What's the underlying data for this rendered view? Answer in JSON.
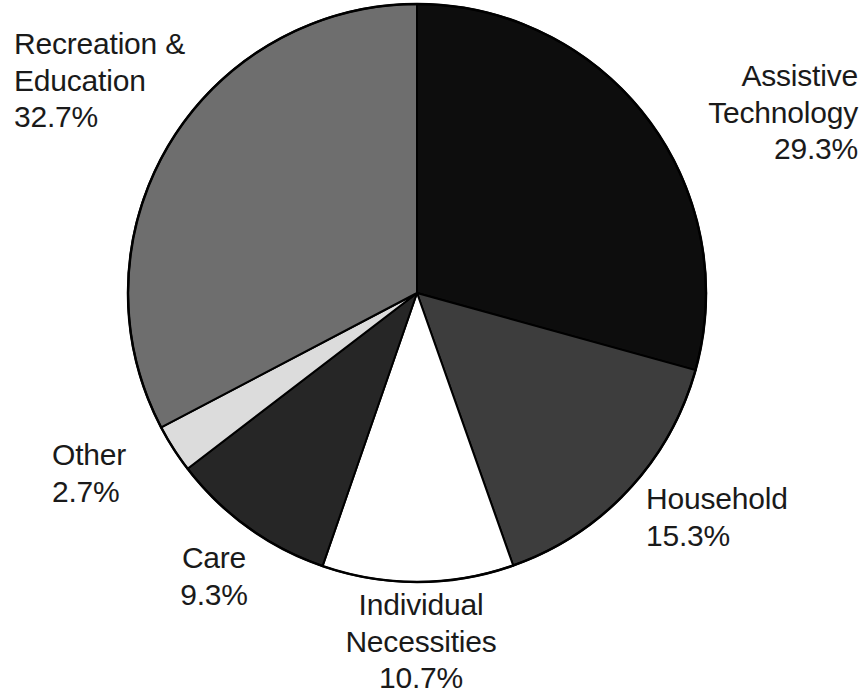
{
  "chart_data": {
    "type": "pie",
    "title": "",
    "subtitle": "",
    "xlabel": "",
    "ylabel": "",
    "legend_position": "none",
    "grid": false,
    "value_unit": "percent",
    "start_angle_deg": 0,
    "direction": "clockwise",
    "categories": [
      "Assistive Technology",
      "Household",
      "Individual Necessities",
      "Care",
      "Other",
      "Recreation & Education"
    ],
    "values": [
      29.3,
      15.3,
      10.7,
      9.3,
      2.7,
      32.7
    ],
    "colors": [
      "#0d0d0d",
      "#3d3d3d",
      "#ffffff",
      "#262626",
      "#dcdcdc",
      "#6e6e6e"
    ],
    "slices": [
      {
        "label": "Assistive Technology",
        "value": 29.3,
        "value_label": "29.3%",
        "color": "#0d0d0d",
        "start_deg": 0,
        "end_deg": 105.48
      },
      {
        "label": "Household",
        "value": 15.3,
        "value_label": "15.3%",
        "color": "#3d3d3d",
        "start_deg": 105.48,
        "end_deg": 160.56
      },
      {
        "label": "Individual Necessities",
        "value": 10.7,
        "value_label": "10.7%",
        "color": "#ffffff",
        "start_deg": 160.56,
        "end_deg": 199.08
      },
      {
        "label": "Care",
        "value": 9.3,
        "value_label": "9.3%",
        "color": "#262626",
        "start_deg": 199.08,
        "end_deg": 232.56
      },
      {
        "label": "Other",
        "value": 2.7,
        "value_label": "2.7%",
        "color": "#dcdcdc",
        "start_deg": 232.56,
        "end_deg": 242.28
      },
      {
        "label": "Recreation & Education",
        "value": 32.7,
        "value_label": "32.7%",
        "color": "#6e6e6e",
        "start_deg": 242.28,
        "end_deg": 360
      }
    ],
    "outline_color": "#000000"
  },
  "labels": {
    "recreation": "Recreation &\nEducation\n32.7%",
    "assistive": "Assistive\nTechnology\n29.3%",
    "household": "Household\n15.3%",
    "individual": "Individual\nNecessities\n10.7%",
    "care": "Care\n9.3%",
    "other": "Other\n2.7%"
  },
  "geometry": {
    "center_x": 417,
    "center_y": 293,
    "radius": 289
  }
}
